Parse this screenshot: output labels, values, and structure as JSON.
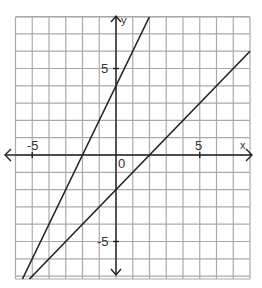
{
  "chart_data": {
    "type": "line",
    "title": "",
    "xlabel": "x",
    "ylabel": "y",
    "xlim": [
      -6,
      8
    ],
    "ylim": [
      -7.2,
      8
    ],
    "grid": true,
    "x_ticks_labeled": [
      {
        "value": -5,
        "label": "-5"
      },
      {
        "value": 0,
        "label": "0"
      },
      {
        "value": 5,
        "label": "5"
      }
    ],
    "y_ticks_labeled": [
      {
        "value": 5,
        "label": "5"
      },
      {
        "value": -5,
        "label": "-5"
      }
    ],
    "series": [
      {
        "name": "steep line",
        "equation": "y = 2x + 4",
        "slope": 2,
        "intercept": 4,
        "x_intercept": -2,
        "y_intercept": 4
      },
      {
        "name": "shallow line",
        "equation": "y = x - 2",
        "slope": 1,
        "intercept": -2,
        "x_intercept": 2,
        "y_intercept": -2
      }
    ]
  },
  "labels": {
    "x_axis": "x",
    "y_axis": "y",
    "origin": "0",
    "x_pos5": "5",
    "x_neg5": "-5",
    "y_pos5": "5",
    "y_neg5": "-5"
  },
  "colors": {
    "grid": "#aaaaaa",
    "axis": "#222222",
    "line": "#222222",
    "text": "#333333"
  }
}
